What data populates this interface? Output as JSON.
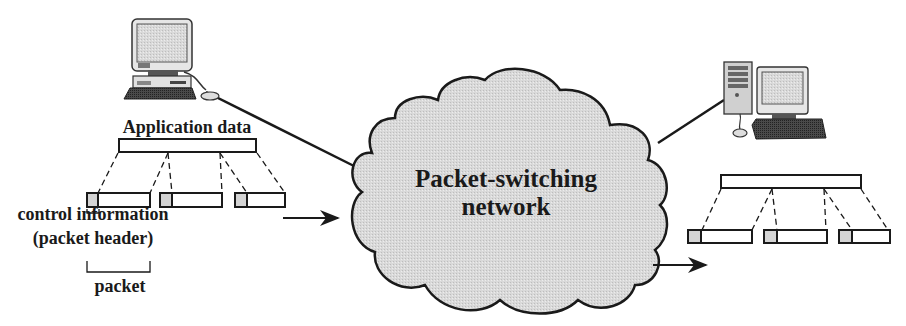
{
  "diagram": {
    "network_label_line1": "Packet-switching",
    "network_label_line2": "network",
    "application_data_label": "Application data",
    "control_info_label": "control information",
    "packet_header_label": "(packet header)",
    "packet_label": "packet",
    "sender": {
      "icon": "desktop-computer-icon",
      "packets": 3
    },
    "receiver": {
      "icon": "desktop-tower-computer-icon",
      "packets": 3
    },
    "colors": {
      "line": "#1a1a1a",
      "cloud_fill": "#dcdcdc",
      "header_fill": "#d4d4d4",
      "payload_fill": "#ffffff"
    }
  }
}
